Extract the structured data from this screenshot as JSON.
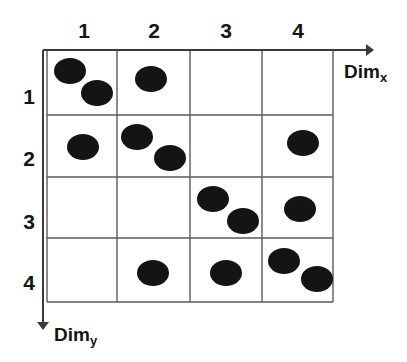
{
  "figure": {
    "type": "scatter-grid",
    "background_color": "#ffffff",
    "ink_color": "#141414",
    "grid_line_color": "#5a5a5a"
  },
  "axes": {
    "x_label_text": "Dim",
    "x_label_subscript": "x",
    "y_label_text": "Dim",
    "y_label_subscript": "y",
    "x_arrow": "arrow-right",
    "y_arrow": "arrow-down"
  },
  "column_headers": [
    "1",
    "2",
    "3",
    "4"
  ],
  "row_headers": [
    "1",
    "2",
    "3",
    "4"
  ],
  "chart_data": {
    "type": "scatter",
    "title": "",
    "xlabel": "Dim_x",
    "ylabel": "Dim_y",
    "xlim": [
      0.5,
      4.5
    ],
    "ylim": [
      0.5,
      4.5
    ],
    "grid": true,
    "legend": null,
    "categories_x": [
      "1",
      "2",
      "3",
      "4"
    ],
    "categories_y": [
      "1",
      "2",
      "3",
      "4"
    ],
    "marker": "filled-ellipse",
    "marker_color": "#141414",
    "cell_counts": [
      [
        2,
        1,
        0,
        0
      ],
      [
        1,
        2,
        0,
        1
      ],
      [
        0,
        0,
        2,
        1
      ],
      [
        0,
        1,
        1,
        2
      ]
    ],
    "points": [
      {
        "cell_x": 1,
        "cell_y": 1,
        "px": 70,
        "py": 71
      },
      {
        "cell_x": 1,
        "cell_y": 1,
        "px": 97,
        "py": 93
      },
      {
        "cell_x": 2,
        "cell_y": 1,
        "px": 151,
        "py": 79
      },
      {
        "cell_x": 1,
        "cell_y": 2,
        "px": 83,
        "py": 147
      },
      {
        "cell_x": 2,
        "cell_y": 2,
        "px": 137,
        "py": 137
      },
      {
        "cell_x": 2,
        "cell_y": 2,
        "px": 170,
        "py": 158
      },
      {
        "cell_x": 4,
        "cell_y": 2,
        "px": 303,
        "py": 143
      },
      {
        "cell_x": 3,
        "cell_y": 3,
        "px": 213,
        "py": 199
      },
      {
        "cell_x": 3,
        "cell_y": 3,
        "px": 243,
        "py": 221
      },
      {
        "cell_x": 4,
        "cell_y": 3,
        "px": 300,
        "py": 209
      },
      {
        "cell_x": 2,
        "cell_y": 4,
        "px": 153,
        "py": 273
      },
      {
        "cell_x": 3,
        "cell_y": 4,
        "px": 226,
        "py": 273
      },
      {
        "cell_x": 4,
        "cell_y": 4,
        "px": 284,
        "py": 261
      },
      {
        "cell_x": 4,
        "cell_y": 4,
        "px": 317,
        "py": 279
      }
    ]
  },
  "geometry": {
    "grid_left": 47,
    "grid_top": 50,
    "grid_right": 333,
    "grid_bottom": 302,
    "col_edges": [
      47,
      117,
      190,
      262,
      333
    ],
    "row_edges": [
      50,
      115,
      177,
      238,
      302
    ],
    "x_axis_arrow_end": 372,
    "y_axis_x": 43,
    "y_axis_arrow_end": 328,
    "marker_rx": 16,
    "marker_ry": 13
  }
}
